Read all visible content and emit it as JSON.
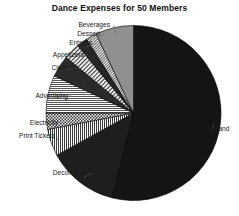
{
  "chart_data": {
    "type": "pie",
    "title": "Dance Expenses for 50 Members",
    "xlabel": "",
    "ylabel": "",
    "legend_position": "none",
    "grid": false,
    "labels_outside": true,
    "categories": [
      "Band",
      "Decorations",
      "Print Tickets",
      "Electricity",
      "Advertising",
      "Clean up",
      "Appetizers",
      "Entrees",
      "Dessert",
      "Beverages"
    ],
    "values": [
      54,
      13,
      5,
      3,
      7,
      4,
      3,
      2,
      2,
      7
    ],
    "units": "percent",
    "series": [
      {
        "name": "Dance Expenses",
        "values": [
          54,
          13,
          5,
          3,
          7,
          4,
          3,
          2,
          2,
          7
        ]
      }
    ],
    "slices": [
      {
        "label": "Band",
        "value": 54,
        "start_deg": 0,
        "end_deg": 194.4,
        "fill": "#141414",
        "pattern": "solid-dark"
      },
      {
        "label": "Decorations",
        "value": 13,
        "start_deg": 194.4,
        "end_deg": 241.2,
        "fill": "#1e1e1e",
        "pattern": "solid-dark"
      },
      {
        "label": "Print Tickets",
        "value": 5,
        "start_deg": 241.2,
        "end_deg": 259.2,
        "fill": "#d8d8d8",
        "pattern": "vertical-lines"
      },
      {
        "label": "Electricity",
        "value": 3,
        "start_deg": 259.2,
        "end_deg": 270.0,
        "fill": "#cccccc",
        "pattern": "checkerboard"
      },
      {
        "label": "Advertising",
        "value": 7,
        "start_deg": 270.0,
        "end_deg": 295.2,
        "fill": "#e0e0e0",
        "pattern": "horizontal-lines"
      },
      {
        "label": "Clean up",
        "value": 4,
        "start_deg": 295.2,
        "end_deg": 309.6,
        "fill": "#2a2a2a",
        "pattern": "solid-dark"
      },
      {
        "label": "Appetizers",
        "value": 3,
        "start_deg": 309.6,
        "end_deg": 320.4,
        "fill": "#dedede",
        "pattern": "diagonal-lines"
      },
      {
        "label": "Entrees",
        "value": 2,
        "start_deg": 320.4,
        "end_deg": 327.6,
        "fill": "#262626",
        "pattern": "solid-dark"
      },
      {
        "label": "Dessert",
        "value": 2,
        "start_deg": 327.6,
        "end_deg": 334.8,
        "fill": "#cfcfcf",
        "pattern": "fine-diagonal"
      },
      {
        "label": "Beverages",
        "value": 7,
        "start_deg": 334.8,
        "end_deg": 360.0,
        "fill": "#909090",
        "pattern": "solid-gray"
      }
    ],
    "colors": {
      "band": "#141414",
      "decorations": "#1e1e1e",
      "print_tickets": "#d8d8d8",
      "electricity": "#cccccc",
      "advertising": "#e0e0e0",
      "clean_up": "#2a2a2a",
      "appetizers": "#dedede",
      "entrees": "#262626",
      "dessert": "#cfcfcf",
      "beverages": "#909090",
      "background": "#ffffff",
      "text": "#1a1a1a",
      "outline": "#000000"
    }
  },
  "labels": {
    "band": "Band",
    "decorations": "Decorations",
    "print_tickets": "Print Tickets",
    "electricity": "Electricity",
    "advertising": "Advertising",
    "clean_up": "Clean up",
    "appetizers": "Appetizers",
    "entrees": "Entrees",
    "dessert": "Dessert",
    "beverages": "Beverages"
  }
}
